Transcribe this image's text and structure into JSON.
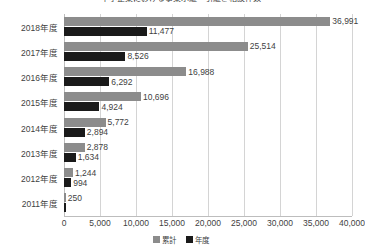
{
  "chart_data": {
    "type": "bar",
    "orientation": "horizontal",
    "title": "中小企業における事業承継・引継ぎ相談件数",
    "xlabel": "",
    "ylabel": "",
    "xlim": [
      0,
      40000
    ],
    "grid": true,
    "legend_position": "bottom",
    "categories": [
      "2018年度",
      "2017年度",
      "2016年度",
      "2015年度",
      "2014年度",
      "2013年度",
      "2012年度",
      "2011年度"
    ],
    "tick_labels": [
      "0",
      "5,000",
      "10,000",
      "15,000",
      "20,000",
      "25,000",
      "30,000",
      "35,000",
      "40,000"
    ],
    "tick_values": [
      0,
      5000,
      10000,
      15000,
      20000,
      25000,
      30000,
      35000,
      40000
    ],
    "series": [
      {
        "name": "累計",
        "color": "#8c8c8c",
        "values": [
          36991,
          25514,
          16988,
          10696,
          5772,
          2878,
          1244,
          250
        ],
        "labels": [
          "36,991",
          "25,514",
          "16,988",
          "10,696",
          "5,772",
          "2,878",
          "1,244",
          "250"
        ]
      },
      {
        "name": "年度",
        "color": "#1a1a1a",
        "values": [
          11477,
          8526,
          6292,
          4924,
          2894,
          1634,
          994,
          250
        ],
        "labels": [
          "11,477",
          "8,526",
          "6,292",
          "4,924",
          "2,894",
          "1,634",
          "994",
          ""
        ]
      }
    ]
  }
}
